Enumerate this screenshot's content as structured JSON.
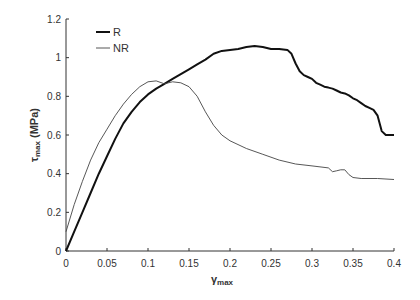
{
  "chart_data": {
    "type": "line",
    "title": "",
    "xlabel": "γmax",
    "ylabel": "τmax (MPa)",
    "xlim": [
      0,
      0.4
    ],
    "ylim": [
      0,
      1.2
    ],
    "xticks": [
      "0",
      "0.05",
      "0.1",
      "0.15",
      "0.2",
      "0.25",
      "0.3",
      "0.35",
      "0.4"
    ],
    "yticks": [
      "0",
      "0.2",
      "0.4",
      "0.6",
      "0.8",
      "1",
      "1.2"
    ],
    "grid": false,
    "legend_position": "upper-left",
    "series": [
      {
        "name": "R",
        "style": "thick",
        "x": [
          0,
          0.01,
          0.02,
          0.03,
          0.04,
          0.05,
          0.06,
          0.07,
          0.08,
          0.09,
          0.1,
          0.11,
          0.12,
          0.13,
          0.14,
          0.15,
          0.16,
          0.17,
          0.18,
          0.19,
          0.2,
          0.21,
          0.22,
          0.23,
          0.24,
          0.25,
          0.26,
          0.27,
          0.275,
          0.28,
          0.285,
          0.29,
          0.295,
          0.3,
          0.305,
          0.31,
          0.315,
          0.32,
          0.325,
          0.33,
          0.335,
          0.34,
          0.345,
          0.35,
          0.355,
          0.36,
          0.365,
          0.37,
          0.375,
          0.38,
          0.385,
          0.39,
          0.4
        ],
        "y": [
          0,
          0.1,
          0.2,
          0.3,
          0.4,
          0.49,
          0.58,
          0.66,
          0.72,
          0.77,
          0.81,
          0.84,
          0.865,
          0.89,
          0.915,
          0.94,
          0.965,
          0.99,
          1.02,
          1.035,
          1.04,
          1.045,
          1.055,
          1.06,
          1.055,
          1.045,
          1.045,
          1.04,
          1.02,
          0.97,
          0.93,
          0.91,
          0.9,
          0.89,
          0.87,
          0.86,
          0.85,
          0.845,
          0.84,
          0.83,
          0.82,
          0.815,
          0.805,
          0.79,
          0.78,
          0.765,
          0.75,
          0.74,
          0.73,
          0.7,
          0.62,
          0.6,
          0.6
        ]
      },
      {
        "name": "NR",
        "style": "thin",
        "x": [
          0,
          0.01,
          0.02,
          0.03,
          0.04,
          0.05,
          0.06,
          0.07,
          0.08,
          0.09,
          0.1,
          0.11,
          0.12,
          0.13,
          0.14,
          0.15,
          0.16,
          0.17,
          0.18,
          0.19,
          0.2,
          0.22,
          0.24,
          0.26,
          0.28,
          0.3,
          0.32,
          0.325,
          0.33,
          0.335,
          0.34,
          0.345,
          0.35,
          0.36,
          0.38,
          0.4
        ],
        "y": [
          0.1,
          0.24,
          0.36,
          0.47,
          0.56,
          0.63,
          0.7,
          0.76,
          0.81,
          0.85,
          0.875,
          0.88,
          0.865,
          0.875,
          0.87,
          0.85,
          0.8,
          0.72,
          0.65,
          0.6,
          0.57,
          0.53,
          0.5,
          0.47,
          0.45,
          0.44,
          0.43,
          0.41,
          0.415,
          0.42,
          0.42,
          0.395,
          0.38,
          0.375,
          0.375,
          0.37
        ]
      }
    ]
  }
}
